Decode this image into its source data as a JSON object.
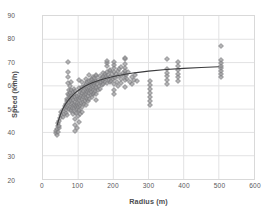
{
  "chart_data": {
    "type": "scatter",
    "title": "",
    "xlabel": "Radius (m)",
    "ylabel": "Speed (km/h)",
    "xlim": [
      0,
      600
    ],
    "ylim": [
      20,
      90
    ],
    "xticks": [
      0,
      100,
      200,
      300,
      400,
      500,
      600
    ],
    "yticks": [
      20,
      30,
      40,
      50,
      60,
      70,
      80,
      90
    ],
    "grid": true,
    "legend": "none",
    "marker": "diamond",
    "marker_color": "#9a9a9c",
    "trendline_color": "#3b3b3d",
    "trendline_type": "logarithmic",
    "series": [
      {
        "name": "Observations",
        "points": [
          [
            38,
            40.2
          ],
          [
            38,
            41.4
          ],
          [
            40,
            39.6
          ],
          [
            40,
            42.0
          ],
          [
            41,
            43.5
          ],
          [
            42,
            41.0
          ],
          [
            43,
            44.8
          ],
          [
            44,
            42.6
          ],
          [
            45,
            45.4
          ],
          [
            46,
            43.2
          ],
          [
            48,
            46.6
          ],
          [
            50,
            48.0
          ],
          [
            52,
            49.2
          ],
          [
            55,
            47.0
          ],
          [
            58,
            50.5
          ],
          [
            60,
            48.4
          ],
          [
            62,
            51.8
          ],
          [
            64,
            50.0
          ],
          [
            65,
            52.6
          ],
          [
            66,
            49.0
          ],
          [
            67,
            53.8
          ],
          [
            68,
            51.2
          ],
          [
            68,
            55.0
          ],
          [
            69,
            48.2
          ],
          [
            70,
            54.5
          ],
          [
            70,
            57.0
          ],
          [
            70,
            61.5
          ],
          [
            70,
            64.0
          ],
          [
            70,
            66.2
          ],
          [
            70,
            70.5
          ],
          [
            71,
            52.0
          ],
          [
            72,
            56.4
          ],
          [
            72,
            58.8
          ],
          [
            73,
            50.6
          ],
          [
            74,
            53.4
          ],
          [
            75,
            55.8
          ],
          [
            75,
            60.2
          ],
          [
            76,
            51.4
          ],
          [
            77,
            57.2
          ],
          [
            78,
            54.0
          ],
          [
            78,
            62.0
          ],
          [
            79,
            49.8
          ],
          [
            80,
            52.8
          ],
          [
            80,
            56.0
          ],
          [
            80,
            58.4
          ],
          [
            80,
            50.2
          ],
          [
            81,
            53.0
          ],
          [
            82,
            55.2
          ],
          [
            83,
            51.0
          ],
          [
            84,
            57.6
          ],
          [
            85,
            54.4
          ],
          [
            85,
            48.6
          ],
          [
            86,
            52.2
          ],
          [
            87,
            56.8
          ],
          [
            88,
            50.8
          ],
          [
            88,
            59.0
          ],
          [
            89,
            53.6
          ],
          [
            90,
            46.4
          ],
          [
            90,
            49.4
          ],
          [
            90,
            52.0
          ],
          [
            90,
            55.6
          ],
          [
            90,
            58.0
          ],
          [
            90,
            41.2
          ],
          [
            91,
            43.8
          ],
          [
            92,
            51.6
          ],
          [
            93,
            54.8
          ],
          [
            94,
            48.8
          ],
          [
            95,
            52.4
          ],
          [
            95,
            56.2
          ],
          [
            95,
            42.4
          ],
          [
            96,
            50.4
          ],
          [
            97,
            53.2
          ],
          [
            98,
            47.6
          ],
          [
            98,
            55.0
          ],
          [
            99,
            51.2
          ],
          [
            100,
            45.0
          ],
          [
            100,
            49.6
          ],
          [
            100,
            52.8
          ],
          [
            100,
            56.6
          ],
          [
            100,
            59.4
          ],
          [
            100,
            62.8
          ],
          [
            101,
            50.0
          ],
          [
            102,
            54.2
          ],
          [
            103,
            57.8
          ],
          [
            104,
            52.0
          ],
          [
            105,
            55.4
          ],
          [
            105,
            48.4
          ],
          [
            106,
            58.6
          ],
          [
            107,
            53.0
          ],
          [
            108,
            56.0
          ],
          [
            109,
            51.4
          ],
          [
            110,
            54.6
          ],
          [
            110,
            57.4
          ],
          [
            110,
            60.0
          ],
          [
            110,
            62.2
          ],
          [
            110,
            49.2
          ],
          [
            112,
            55.8
          ],
          [
            113,
            58.2
          ],
          [
            114,
            53.4
          ],
          [
            115,
            56.6
          ],
          [
            115,
            59.8
          ],
          [
            116,
            52.6
          ],
          [
            117,
            57.0
          ],
          [
            118,
            54.0
          ],
          [
            119,
            60.4
          ],
          [
            120,
            55.2
          ],
          [
            120,
            58.0
          ],
          [
            120,
            61.0
          ],
          [
            120,
            63.2
          ],
          [
            120,
            52.2
          ],
          [
            122,
            56.8
          ],
          [
            123,
            59.2
          ],
          [
            124,
            54.8
          ],
          [
            125,
            57.6
          ],
          [
            125,
            61.8
          ],
          [
            126,
            53.8
          ],
          [
            127,
            58.8
          ],
          [
            128,
            56.2
          ],
          [
            129,
            60.6
          ],
          [
            130,
            57.2
          ],
          [
            130,
            59.6
          ],
          [
            130,
            62.4
          ],
          [
            130,
            55.0
          ],
          [
            130,
            64.8
          ],
          [
            132,
            58.4
          ],
          [
            133,
            61.2
          ],
          [
            134,
            56.4
          ],
          [
            135,
            59.0
          ],
          [
            135,
            62.8
          ],
          [
            136,
            57.8
          ],
          [
            137,
            60.2
          ],
          [
            138,
            55.6
          ],
          [
            139,
            63.4
          ],
          [
            140,
            58.6
          ],
          [
            140,
            61.4
          ],
          [
            140,
            64.2
          ],
          [
            140,
            56.8
          ],
          [
            142,
            59.8
          ],
          [
            143,
            62.0
          ],
          [
            144,
            57.4
          ],
          [
            145,
            60.8
          ],
          [
            145,
            63.6
          ],
          [
            146,
            58.2
          ],
          [
            147,
            61.6
          ],
          [
            148,
            59.4
          ],
          [
            149,
            64.4
          ],
          [
            150,
            60.0
          ],
          [
            150,
            62.6
          ],
          [
            150,
            65.0
          ],
          [
            150,
            57.0
          ],
          [
            150,
            54.2
          ],
          [
            152,
            61.0
          ],
          [
            155,
            63.0
          ],
          [
            155,
            58.8
          ],
          [
            158,
            60.4
          ],
          [
            160,
            62.2
          ],
          [
            160,
            64.6
          ],
          [
            160,
            59.2
          ],
          [
            162,
            61.8
          ],
          [
            165,
            63.8
          ],
          [
            165,
            60.6
          ],
          [
            168,
            62.4
          ],
          [
            170,
            64.0
          ],
          [
            170,
            61.2
          ],
          [
            170,
            66.0
          ],
          [
            172,
            63.2
          ],
          [
            175,
            65.2
          ],
          [
            175,
            62.0
          ],
          [
            178,
            64.4
          ],
          [
            180,
            66.4
          ],
          [
            180,
            63.6
          ],
          [
            180,
            61.4
          ],
          [
            180,
            68.8
          ],
          [
            180,
            70.2
          ],
          [
            180,
            71.0
          ],
          [
            182,
            65.0
          ],
          [
            185,
            63.0
          ],
          [
            188,
            66.8
          ],
          [
            190,
            64.2
          ],
          [
            190,
            61.8
          ],
          [
            190,
            67.2
          ],
          [
            192,
            62.6
          ],
          [
            195,
            65.6
          ],
          [
            198,
            63.4
          ],
          [
            200,
            66.2
          ],
          [
            200,
            64.0
          ],
          [
            200,
            61.0
          ],
          [
            200,
            58.6
          ],
          [
            200,
            68.0
          ],
          [
            200,
            69.4
          ],
          [
            200,
            70.6
          ],
          [
            200,
            56.8
          ],
          [
            202,
            63.8
          ],
          [
            205,
            65.4
          ],
          [
            208,
            62.2
          ],
          [
            210,
            66.6
          ],
          [
            210,
            64.6
          ],
          [
            212,
            60.4
          ],
          [
            215,
            67.4
          ],
          [
            218,
            65.0
          ],
          [
            220,
            63.2
          ],
          [
            220,
            68.2
          ],
          [
            220,
            61.6
          ],
          [
            225,
            66.0
          ],
          [
            228,
            64.4
          ],
          [
            230,
            67.8
          ],
          [
            230,
            65.6
          ],
          [
            230,
            62.8
          ],
          [
            230,
            69.8
          ],
          [
            230,
            71.6
          ],
          [
            230,
            72.2
          ],
          [
            230,
            60.0
          ],
          [
            232,
            66.8
          ],
          [
            235,
            64.8
          ],
          [
            238,
            63.4
          ],
          [
            240,
            66.4
          ],
          [
            245,
            62.0
          ],
          [
            250,
            64.2
          ],
          [
            250,
            61.2
          ],
          [
            255,
            63.0
          ],
          [
            260,
            65.0
          ],
          [
            265,
            62.4
          ],
          [
            300,
            52.2
          ],
          [
            300,
            54.0
          ],
          [
            300,
            55.6
          ],
          [
            300,
            57.4
          ],
          [
            300,
            59.0
          ],
          [
            300,
            60.8
          ],
          [
            300,
            62.6
          ],
          [
            350,
            61.0
          ],
          [
            350,
            62.8
          ],
          [
            350,
            64.4
          ],
          [
            350,
            66.0
          ],
          [
            350,
            67.6
          ],
          [
            350,
            71.8
          ],
          [
            380,
            64.0
          ],
          [
            380,
            65.6
          ],
          [
            380,
            67.2
          ],
          [
            380,
            69.0
          ],
          [
            380,
            70.4
          ],
          [
            380,
            62.6
          ],
          [
            500,
            64.2
          ],
          [
            500,
            65.4
          ],
          [
            500,
            66.6
          ],
          [
            500,
            67.8
          ],
          [
            500,
            69.0
          ],
          [
            500,
            70.2
          ],
          [
            500,
            71.4
          ],
          [
            500,
            77.4
          ]
        ]
      }
    ],
    "trendline": [
      [
        40,
        43.0
      ],
      [
        45,
        45.6
      ],
      [
        50,
        47.8
      ],
      [
        55,
        49.6
      ],
      [
        60,
        51.1
      ],
      [
        65,
        52.4
      ],
      [
        70,
        53.5
      ],
      [
        80,
        55.3
      ],
      [
        90,
        56.8
      ],
      [
        100,
        58.0
      ],
      [
        120,
        59.9
      ],
      [
        140,
        61.3
      ],
      [
        160,
        62.4
      ],
      [
        180,
        63.3
      ],
      [
        200,
        64.0
      ],
      [
        230,
        64.9
      ],
      [
        260,
        65.6
      ],
      [
        300,
        66.3
      ],
      [
        350,
        67.0
      ],
      [
        400,
        67.5
      ],
      [
        450,
        67.9
      ],
      [
        500,
        68.2
      ]
    ]
  }
}
